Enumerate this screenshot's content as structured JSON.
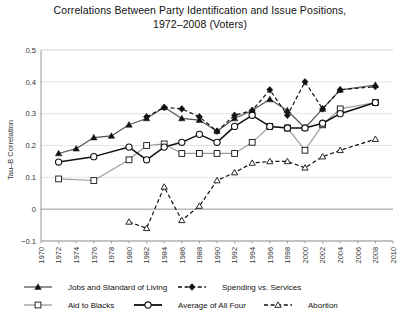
{
  "chart_data": {
    "type": "line",
    "title": "Correlations Between Party Identification and Issue Positions, 1972–2008 (Voters)",
    "title_line1": "Correlations Between Party Identification and Issue Positions,",
    "title_line2": "1972–2008 (Voters)",
    "xlabel": "",
    "ylabel": "Tau–B Correlation",
    "xlim": [
      1970,
      2010
    ],
    "ylim": [
      -0.1,
      0.5
    ],
    "grid": true,
    "legend_position": "bottom",
    "x_ticks": [
      1970,
      1972,
      1974,
      1976,
      1978,
      1980,
      1982,
      1984,
      1986,
      1988,
      1990,
      1992,
      1994,
      1996,
      1998,
      2000,
      2002,
      2004,
      2006,
      2008,
      2010
    ],
    "y_ticks": [
      -0.1,
      0,
      0.1,
      0.2,
      0.3,
      0.4,
      0.5
    ],
    "y_tick_labels": [
      "−0.1",
      "0",
      "0.1",
      "0.2",
      "0.3",
      "0.4",
      "0.5"
    ],
    "series": [
      {
        "name": "Jobs and Standard of Living",
        "marker": "filled-triangle",
        "line": "solid",
        "color": "#555555",
        "x": [
          1972,
          1974,
          1976,
          1978,
          1980,
          1982,
          1984,
          1986,
          1988,
          1990,
          1992,
          1994,
          1996,
          1998,
          2000,
          2002,
          2004,
          2008
        ],
        "values": [
          0.175,
          0.19,
          0.225,
          0.23,
          0.265,
          0.285,
          0.32,
          0.285,
          0.28,
          0.245,
          0.285,
          0.31,
          0.345,
          0.31,
          0.255,
          0.315,
          0.375,
          0.39
        ]
      },
      {
        "name": "Spending vs. Services",
        "marker": "filled-diamond",
        "line": "dashed",
        "color": "#111111",
        "x": [
          1982,
          1984,
          1986,
          1988,
          1990,
          1992,
          1994,
          1996,
          1998,
          2000,
          2002,
          2004,
          2008
        ],
        "values": [
          0.29,
          0.32,
          0.315,
          0.29,
          0.245,
          0.295,
          0.31,
          0.375,
          0.295,
          0.4,
          0.315,
          0.375,
          0.385
        ]
      },
      {
        "name": "Aid to Blacks",
        "marker": "open-square",
        "line": "solid",
        "color": "#9a9a9a",
        "x": [
          1972,
          1976,
          1980,
          1982,
          1984,
          1986,
          1988,
          1990,
          1992,
          1994,
          1996,
          1998,
          2000,
          2002,
          2004,
          2008
        ],
        "values": [
          0.095,
          0.09,
          0.155,
          0.2,
          0.205,
          0.175,
          0.175,
          0.175,
          0.175,
          0.21,
          0.26,
          0.255,
          0.185,
          0.265,
          0.315,
          0.335
        ]
      },
      {
        "name": "Average of All Four",
        "marker": "open-circle",
        "line": "solid",
        "color": "#111111",
        "x": [
          1972,
          1976,
          1980,
          1982,
          1984,
          1986,
          1988,
          1990,
          1992,
          1994,
          1996,
          1998,
          2000,
          2002,
          2004,
          2008
        ],
        "values": [
          0.148,
          0.165,
          0.195,
          0.155,
          0.195,
          0.21,
          0.235,
          0.21,
          0.26,
          0.295,
          0.26,
          0.255,
          0.255,
          0.27,
          0.3,
          0.335
        ]
      },
      {
        "name": "Abortion",
        "marker": "open-triangle",
        "line": "dashed",
        "color": "#111111",
        "x": [
          1980,
          1982,
          1984,
          1986,
          1988,
          1990,
          1992,
          1994,
          1996,
          1998,
          2000,
          2002,
          2004,
          2008
        ],
        "values": [
          -0.04,
          -0.06,
          0.07,
          -0.035,
          0.01,
          0.09,
          0.115,
          0.145,
          0.15,
          0.15,
          0.13,
          0.165,
          0.185,
          0.22
        ]
      }
    ]
  },
  "legend": {
    "items": [
      {
        "label": "Jobs and Standard of Living"
      },
      {
        "label": "Spending vs. Services"
      },
      {
        "label": "Aid to Blacks"
      },
      {
        "label": "Average of All Four"
      },
      {
        "label": "Abortion"
      }
    ]
  }
}
